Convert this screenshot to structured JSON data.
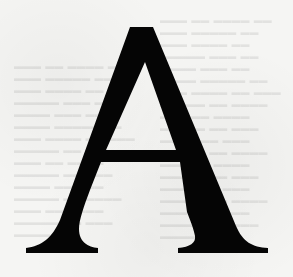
{
  "glyph": {
    "character": "A",
    "style": "serif drop capital",
    "color": "#050505"
  },
  "background": {
    "color": "#f5f5f3",
    "note": "faint bleed-through text, illegible"
  }
}
